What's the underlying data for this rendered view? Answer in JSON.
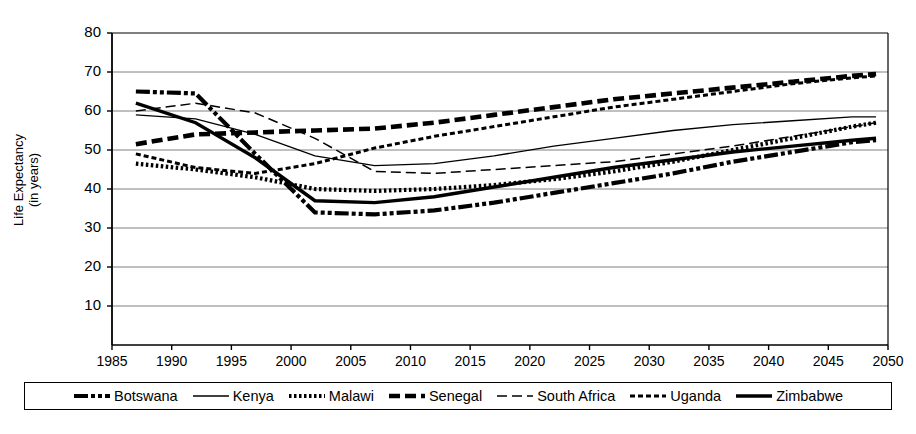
{
  "chart_data": {
    "type": "line",
    "title": "",
    "xlabel": "",
    "ylabel": "Life Expectancy (in years)",
    "ylabel_line1": "Life Expectancy",
    "ylabel_line2": "(in years)",
    "xlim": [
      1985,
      2050
    ],
    "ylim": [
      0,
      80
    ],
    "yticks": [
      10,
      20,
      30,
      40,
      50,
      60,
      70,
      80
    ],
    "xticks": [
      1985,
      1990,
      1995,
      2000,
      2005,
      2010,
      2015,
      2020,
      2025,
      2030,
      2035,
      2040,
      2045,
      2050
    ],
    "grid": "horizontal",
    "legend_position": "bottom",
    "x": [
      1987,
      1992,
      1997,
      2002,
      2007,
      2012,
      2017,
      2022,
      2027,
      2032,
      2037,
      2042,
      2047,
      2049
    ],
    "series": [
      {
        "name": "Botswana",
        "style": "dash-dot-dot-thick",
        "values": [
          65,
          64.5,
          49,
          34,
          33.5,
          34.5,
          36.5,
          39,
          41.5,
          44,
          47,
          49.5,
          52,
          52.5
        ]
      },
      {
        "name": "Kenya",
        "style": "solid-thin",
        "values": [
          59,
          58,
          54,
          48.5,
          46,
          46.5,
          48.5,
          51,
          53,
          55,
          56.5,
          57.5,
          58.5,
          58.5
        ]
      },
      {
        "name": "Malawi",
        "style": "dotted-thick",
        "values": [
          46.5,
          45,
          43,
          40,
          39.5,
          40,
          41,
          42.5,
          44.5,
          47,
          50,
          53,
          56,
          57
        ]
      },
      {
        "name": "Senegal",
        "style": "dashed-thick",
        "values": [
          51.5,
          54,
          54.5,
          55,
          55.5,
          57,
          59,
          61,
          63,
          64.5,
          66,
          67.5,
          69,
          69.5
        ]
      },
      {
        "name": "South Africa",
        "style": "dashed-thin",
        "values": [
          60,
          62,
          59.5,
          53,
          44.5,
          44,
          45,
          46,
          47,
          49,
          51,
          53.5,
          56,
          57
        ]
      },
      {
        "name": "Uganda",
        "style": "dotted-medium",
        "values": [
          49,
          45.5,
          44,
          46.5,
          50.5,
          53.5,
          56,
          58.5,
          61,
          63,
          65,
          67,
          68.5,
          69
        ]
      },
      {
        "name": "Zimbabwe",
        "style": "solid-thick",
        "values": [
          62,
          57,
          48,
          37,
          36.5,
          38,
          40.5,
          43,
          45.5,
          47.5,
          49.5,
          51,
          52.5,
          53
        ]
      }
    ]
  },
  "legend": {
    "items": [
      {
        "label": "Botswana",
        "style": "dash-dot-dot-thick"
      },
      {
        "label": "Kenya",
        "style": "solid-thin"
      },
      {
        "label": "Malawi",
        "style": "dotted-thick"
      },
      {
        "label": "Senegal",
        "style": "dashed-thick"
      },
      {
        "label": "South Africa",
        "style": "dashed-thin"
      },
      {
        "label": "Uganda",
        "style": "dotted-medium"
      },
      {
        "label": "Zimbabwe",
        "style": "solid-thick"
      }
    ]
  },
  "colors": {
    "line": "#000000",
    "grid": "#808080",
    "axis": "#000000",
    "background": "#ffffff"
  }
}
